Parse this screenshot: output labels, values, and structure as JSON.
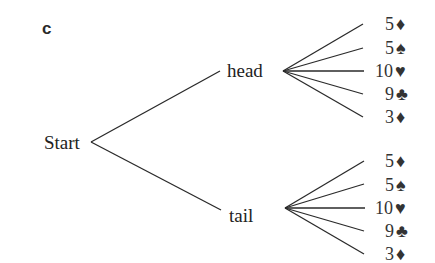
{
  "part_label": "c",
  "tree": {
    "root": "Start",
    "branches": [
      {
        "label": "head",
        "outcomes": [
          {
            "value": "5",
            "suit": "diamond",
            "symbol": "♦"
          },
          {
            "value": "5",
            "suit": "spade",
            "symbol": "♠"
          },
          {
            "value": "10",
            "suit": "heart",
            "symbol": "♥"
          },
          {
            "value": "9",
            "suit": "club",
            "symbol": "♣"
          },
          {
            "value": "3",
            "suit": "diamond",
            "symbol": "♦"
          }
        ]
      },
      {
        "label": "tail",
        "outcomes": [
          {
            "value": "5",
            "suit": "diamond",
            "symbol": "♦"
          },
          {
            "value": "5",
            "suit": "spade",
            "symbol": "♠"
          },
          {
            "value": "10",
            "suit": "heart",
            "symbol": "♥"
          },
          {
            "value": "9",
            "suit": "club",
            "symbol": "♣"
          },
          {
            "value": "3",
            "suit": "diamond",
            "symbol": "♦"
          }
        ]
      }
    ]
  }
}
